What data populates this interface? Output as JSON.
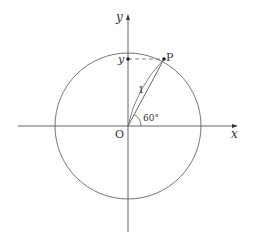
{
  "diagram": {
    "type": "unit-circle",
    "colors": {
      "stroke": "#555555",
      "text": "#333333",
      "background": "#ffffff"
    },
    "axes": {
      "x_label": "x",
      "y_label": "y"
    },
    "origin_label": "O",
    "point": {
      "label": "P",
      "projection_label": "y"
    },
    "radius_label": "1",
    "angle_label": "60°"
  }
}
